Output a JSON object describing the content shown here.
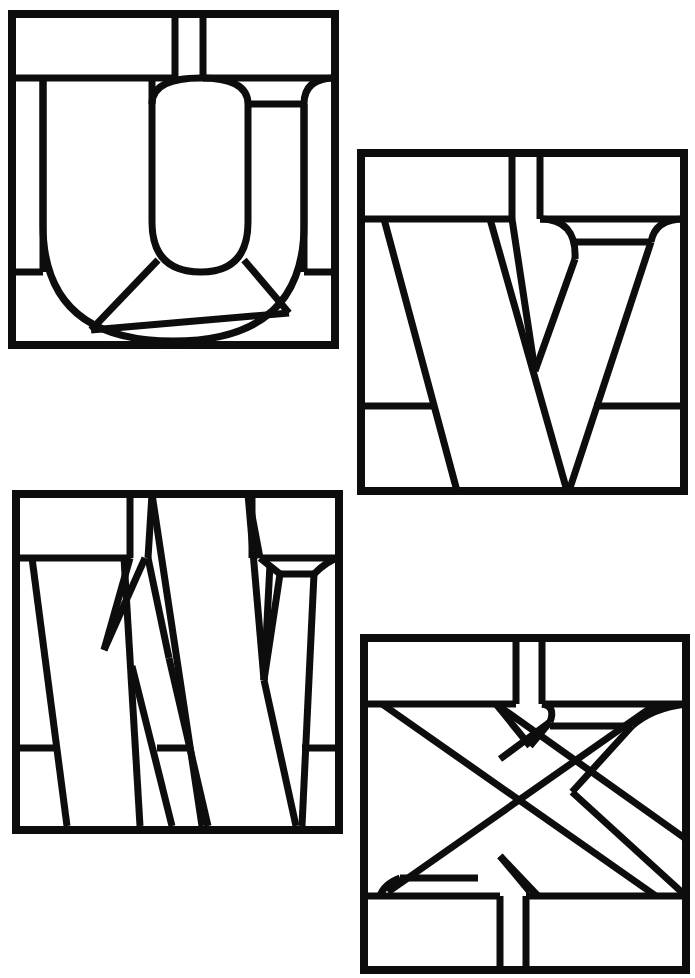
{
  "document": {
    "title": "Stained Glass Alphabet Patterns U V W X",
    "kind": "line-art-pattern-sheet",
    "background_color": "#ffffff",
    "line_color": "#0d0d0d",
    "page_width": 695,
    "page_height": 978,
    "panel_count": 4
  },
  "panels": [
    {
      "id": "panel-u",
      "letter": "U",
      "label": "Stained glass letter U panel",
      "position": {
        "x": 8,
        "y": 10,
        "width": 331,
        "height": 339
      },
      "glass_pieces": 11,
      "notes": "Letter U with rounded bowl, two top border rectangles split by narrow vertical strips, bottom border band, radiating bottom fan lines"
    },
    {
      "id": "panel-v",
      "letter": "V",
      "label": "Stained glass letter V panel",
      "position": {
        "x": 357,
        "y": 149,
        "width": 331,
        "height": 346
      },
      "glass_pieces": 10,
      "notes": "Letter V with diagonal strokes, top border band split by narrow vertical strips, left and right lower border rectangles, curved serif at upper right"
    },
    {
      "id": "panel-w",
      "letter": "W",
      "label": "Stained glass letter W panel",
      "position": {
        "x": 12,
        "y": 490,
        "width": 331,
        "height": 344
      },
      "glass_pieces": 13,
      "notes": "Letter W with four diagonal strokes, top border rectangles, lower-left and lower-middle border rectangles, curved serif at right"
    },
    {
      "id": "panel-x",
      "letter": "X",
      "label": "Stained glass letter X panel",
      "position": {
        "x": 360,
        "y": 634,
        "width": 330,
        "height": 340
      },
      "glass_pieces": 12,
      "notes": "Letter X with crossing diagonals, top and bottom border bands each split by narrow vertical strips, curved serifs at upper right and lower left"
    }
  ],
  "alphabet_sequence": [
    "U",
    "V",
    "W",
    "X"
  ],
  "colors": {
    "line": "#0d0d0d",
    "glass": "#ffffff",
    "page": "#ffffff"
  }
}
